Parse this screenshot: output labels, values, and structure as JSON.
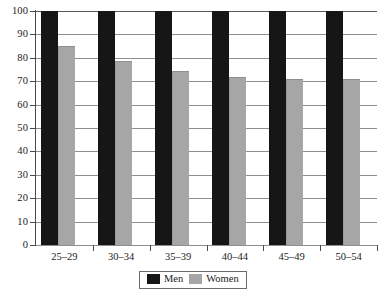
{
  "chart_data": {
    "type": "bar",
    "title": "",
    "subtitle": "",
    "xlabel": "",
    "ylabel": "",
    "categories": [
      "25–29",
      "30–34",
      "35–39",
      "40–44",
      "45–49",
      "50–54"
    ],
    "series": [
      {
        "name": "Men",
        "color": "#161616",
        "values": [
          100,
          100,
          100,
          100,
          100,
          100
        ]
      },
      {
        "name": "Women",
        "color": "#a6a6a6",
        "values": [
          85,
          78.5,
          74.5,
          72,
          71,
          71
        ]
      }
    ],
    "ylim": [
      0,
      100
    ],
    "yticks": [
      0,
      10,
      20,
      30,
      40,
      50,
      60,
      70,
      80,
      90,
      100
    ],
    "ytick_labels": [
      "0",
      "10",
      "20",
      "30",
      "40",
      "50",
      "60",
      "70",
      "80",
      "90",
      "100"
    ],
    "grid": true,
    "grid_axis": "y",
    "legend_position": "bottom-center",
    "legend_entries": [
      "Men",
      "Women"
    ],
    "annotations": []
  },
  "axes": {
    "y_labels": [
      "100",
      "90",
      "80",
      "70",
      "60",
      "50",
      "40",
      "30",
      "20",
      "10",
      "0"
    ],
    "x_labels": [
      "25–29",
      "30–34",
      "35–39",
      "40–44",
      "45–49",
      "50–54"
    ]
  },
  "legend": {
    "items": [
      {
        "label": "Men",
        "color": "#161616"
      },
      {
        "label": "Women",
        "color": "#a6a6a6"
      }
    ]
  },
  "colors": {
    "men": "#161616",
    "women": "#a6a6a6",
    "grid": "#8e8e8e",
    "axis": "#4a4a4a",
    "text": "#1b1b1b",
    "background": "#ffffff"
  }
}
